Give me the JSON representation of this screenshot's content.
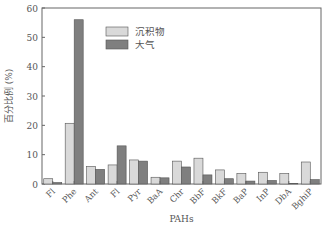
{
  "chart_data": {
    "type": "bar",
    "title": "",
    "xlabel": "PAHs",
    "ylabel": "百分比例 (%)",
    "ylim": [
      0,
      60
    ],
    "yticks": [
      0,
      10,
      20,
      30,
      40,
      50,
      60
    ],
    "grid": false,
    "legend_position": "upper-center",
    "categories": [
      "Fl",
      "Phe",
      "Ant",
      "Fl",
      "Pyr",
      "BaA",
      "Chr",
      "BbF",
      "BkF",
      "BaP",
      "InP",
      "DbA",
      "BghiP"
    ],
    "series": [
      {
        "name": "沉积物",
        "color": "#d9d9d9",
        "values": [
          1.8,
          20.7,
          6.0,
          6.5,
          8.2,
          2.3,
          7.8,
          8.8,
          4.8,
          3.6,
          4.0,
          3.6,
          7.5
        ]
      },
      {
        "name": "大气",
        "color": "#7f7f7f",
        "values": [
          0.5,
          56.0,
          5.0,
          13.0,
          7.8,
          2.1,
          5.8,
          3.1,
          1.8,
          1.0,
          1.2,
          0.2,
          1.5
        ]
      }
    ]
  }
}
